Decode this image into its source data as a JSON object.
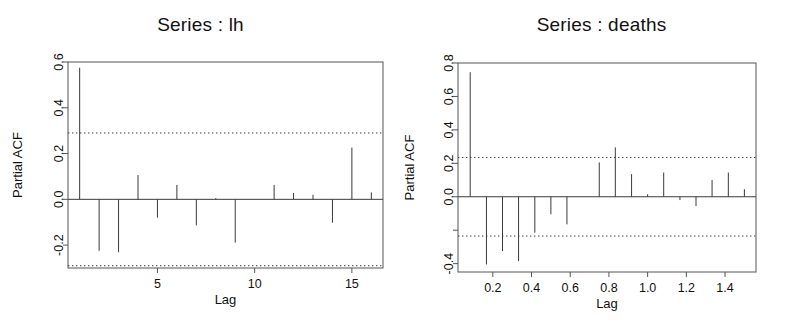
{
  "figure": {
    "background": "#ffffff",
    "line_color": "#3a3a3a",
    "axis_color": "#555555"
  },
  "panels": [
    {
      "id": "lh",
      "title": "Series : lh",
      "ylabel": "Partial ACF",
      "xlabel": "Lag",
      "chart_data": {
        "type": "bar",
        "title": "Series : lh",
        "xlabel": "Lag",
        "ylabel": "Partial ACF",
        "xlim": [
          0.4,
          16.6
        ],
        "ylim": [
          -0.3,
          0.6
        ],
        "xticks": [
          5,
          10,
          15
        ],
        "xticklabels": [
          "5",
          "10",
          "15"
        ],
        "yticks": [
          -0.2,
          0.0,
          0.2,
          0.4,
          0.6
        ],
        "yticklabels": [
          "-0.2",
          "0.0",
          "0.2",
          "0.4",
          "0.6"
        ],
        "grid": false,
        "legend": null,
        "conf_level": 0.29,
        "conf_lines": [
          0.29,
          -0.29
        ],
        "x": [
          1,
          2,
          3,
          4,
          5,
          6,
          7,
          8,
          9,
          10,
          11,
          12,
          13,
          14,
          15,
          16
        ],
        "values": [
          0.575,
          -0.225,
          -0.231,
          0.106,
          -0.08,
          0.063,
          -0.114,
          0.005,
          -0.189,
          0.0,
          0.063,
          0.028,
          0.02,
          -0.102,
          0.226,
          0.03
        ]
      }
    },
    {
      "id": "deaths",
      "title": "Series : deaths",
      "ylabel": "Partial ACF",
      "xlabel": "Lag",
      "chart_data": {
        "type": "bar",
        "title": "Series : deaths",
        "xlabel": "Lag",
        "ylabel": "Partial ACF",
        "xlim": [
          0.02,
          1.56
        ],
        "ylim": [
          -0.45,
          0.8
        ],
        "xticks": [
          0.2,
          0.4,
          0.6,
          0.8,
          1.0,
          1.2,
          1.4
        ],
        "xticklabels": [
          "0.2",
          "0.4",
          "0.6",
          "0.8",
          "1.0",
          "1.2",
          "1.4"
        ],
        "yticks": [
          -0.4,
          -0.2,
          0.0,
          0.2,
          0.4,
          0.6,
          0.8
        ],
        "yticklabels": [
          "-0.4",
          "",
          "0.0",
          "0.2",
          "0.4",
          "0.6",
          "0.8"
        ],
        "grid": false,
        "legend": null,
        "conf_level": 0.235,
        "conf_lines": [
          0.235,
          -0.235
        ],
        "x": [
          0.083,
          0.167,
          0.25,
          0.333,
          0.417,
          0.5,
          0.583,
          0.667,
          0.75,
          0.833,
          0.917,
          1.0,
          1.083,
          1.167,
          1.25,
          1.333,
          1.417,
          1.5
        ],
        "values": [
          0.745,
          -0.405,
          -0.325,
          -0.385,
          -0.215,
          -0.105,
          -0.165,
          0.0,
          0.205,
          0.295,
          0.135,
          0.015,
          0.145,
          -0.02,
          -0.055,
          0.1,
          0.145,
          0.045
        ]
      }
    }
  ]
}
